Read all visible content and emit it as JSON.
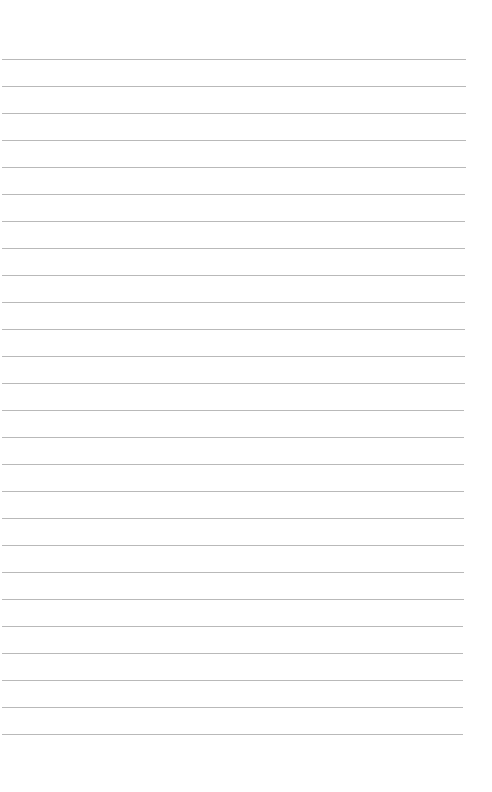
{
  "page": {
    "type": "blank-lined-paper",
    "background_color": "#ffffff",
    "line_color": "#b9b9b9",
    "line_count": 26,
    "first_line_y": 59,
    "line_spacing": 27,
    "line_left": 2,
    "line_right_start": 466,
    "line_right_end": 463
  }
}
